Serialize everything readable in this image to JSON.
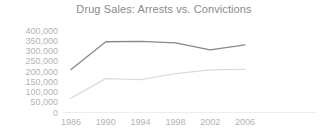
{
  "chart_data": {
    "type": "line",
    "title": "Drug Sales: Arrests vs. Convictions",
    "xlabel": "",
    "ylabel": "",
    "x": [
      1986,
      1990,
      1994,
      1998,
      2002,
      2006
    ],
    "categories": [
      "1986",
      "1990",
      "1994",
      "1998",
      "2002",
      "2006"
    ],
    "ytick_labels": [
      "400,000",
      "350,000",
      "300,000",
      "250,000",
      "200,000",
      "150,000",
      "100,000",
      "50,000",
      "0"
    ],
    "ytick_values": [
      400000,
      350000,
      300000,
      250000,
      200000,
      150000,
      100000,
      50000,
      0
    ],
    "ylim": [
      0,
      400000
    ],
    "grid": false,
    "legend": "none",
    "series": [
      {
        "name": "Arrests",
        "color": "#888888",
        "values": [
          210000,
          345000,
          347000,
          340000,
          305000,
          330000
        ]
      },
      {
        "name": "Convictions",
        "color": "#dcdcdc",
        "values": [
          70000,
          165000,
          160000,
          190000,
          208000,
          210000
        ]
      }
    ]
  },
  "colors": {
    "title": "#8a8a8a",
    "tick_text": "#b3b3b3",
    "axis": "#ededed",
    "background": "#ffffff"
  }
}
